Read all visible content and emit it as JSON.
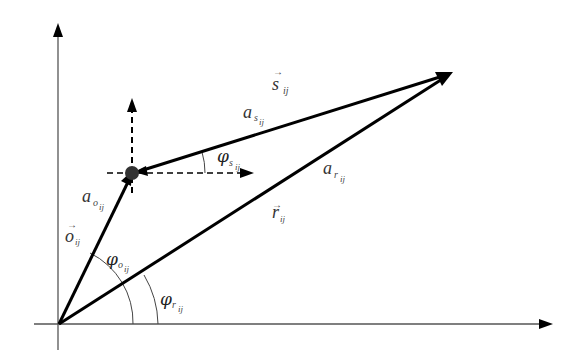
{
  "diagram": {
    "type": "vector-diagram",
    "colors": {
      "stroke": "#000000",
      "axis": "#555555",
      "text": "#333333",
      "background": "#ffffff"
    },
    "points": {
      "origin": [
        59,
        324
      ],
      "node": [
        132,
        173
      ],
      "target": [
        452,
        73
      ]
    },
    "labels": {
      "s_vec": {
        "base": "s",
        "sub": "ij",
        "arrow": "→"
      },
      "a_s": {
        "base": "a",
        "sub1": "s",
        "sub2": "ij"
      },
      "phi_s": {
        "base": "φ",
        "sub1": "s",
        "sub2": "ij"
      },
      "a_r": {
        "base": "a",
        "sub1": "r",
        "sub2": "ij"
      },
      "r_vec": {
        "base": "r",
        "sub": "ij",
        "arrow": "→"
      },
      "a_o": {
        "base": "a",
        "sub1": "o",
        "sub2": "ij"
      },
      "o_vec": {
        "base": "o",
        "sub": "ij",
        "arrow": "→"
      },
      "phi_o": {
        "base": "φ",
        "sub1": "o",
        "sub2": "ij"
      },
      "phi_r": {
        "base": "φ",
        "sub1": "r",
        "sub2": "ij"
      }
    }
  }
}
